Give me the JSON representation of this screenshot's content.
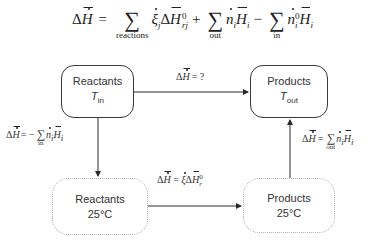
{
  "equation": {
    "lhs": "ΔH",
    "equals": "=",
    "sum_reactions_sub": "reactions",
    "term_reactions": "ξj ΔH°rj",
    "plus": "+",
    "sum_out_sub": "out",
    "term_out": "ni Hi",
    "minus": "−",
    "sum_in_sub": "in",
    "term_in": "ni0 Hi",
    "sum_symbol": "∑"
  },
  "boxes": {
    "reactants_in": {
      "line1": "Reactants",
      "temp_var": "T",
      "temp_sub": "in"
    },
    "products_out": {
      "line1": "Products",
      "temp_var": "T",
      "temp_sub": "out"
    },
    "reactants_25": {
      "line1": "Reactants",
      "line2": "25°C"
    },
    "products_25": {
      "line1": "Products",
      "line2": "25°C"
    }
  },
  "labels": {
    "top_arrow": {
      "lhs": "ΔH",
      "rhs": "= ?"
    },
    "left_arrow": {
      "lhs": "ΔH",
      "rhs": "= −",
      "sum_sub": "in",
      "term": "ni Hi"
    },
    "bottom_arrow": {
      "lhs": "ΔH",
      "rhs": "= ξΔH°r"
    },
    "right_arrow": {
      "lhs": "ΔH",
      "rhs": "=",
      "sum_sub": "out",
      "term": "ni Hi"
    }
  },
  "colors": {
    "stroke": "#3a3a3a",
    "dashed_stroke": "#b0b0b0",
    "text": "#333333"
  }
}
